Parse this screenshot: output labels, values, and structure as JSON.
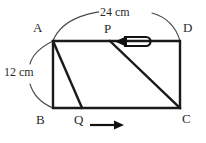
{
  "figure": {
    "shape": "rectangle",
    "stroke_color": "#1a1a1a",
    "arc_color": "#4a4a4a",
    "background": "#ffffff",
    "vertices": [
      {
        "id": "A",
        "label": "A",
        "position": "top-left"
      },
      {
        "id": "D",
        "label": "D",
        "position": "top-right"
      },
      {
        "id": "B",
        "label": "B",
        "position": "bottom-left"
      },
      {
        "id": "C",
        "label": "C",
        "position": "bottom-right"
      }
    ],
    "moving_points": [
      {
        "id": "P",
        "label": "P",
        "edge": "top",
        "direction": "left",
        "arrow": "arrow-left-loop-icon"
      },
      {
        "id": "Q",
        "label": "Q",
        "edge": "bottom",
        "direction": "right",
        "arrow": "arrow-right-icon"
      }
    ],
    "segments": [
      {
        "id": "AQ",
        "from": "A",
        "to": "Q"
      },
      {
        "id": "PC",
        "from": "P",
        "to": "C"
      }
    ],
    "dimensions": [
      {
        "id": "width",
        "value": "24",
        "unit": "cm",
        "text": "24 cm",
        "side": "top",
        "span": "A-D"
      },
      {
        "id": "height",
        "value": "12",
        "unit": "cm",
        "text": "12 cm",
        "side": "left",
        "span": "A-B"
      }
    ]
  }
}
